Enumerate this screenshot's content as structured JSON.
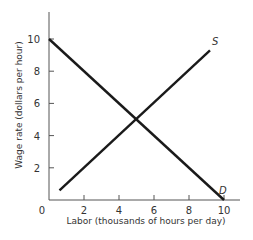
{
  "chart_data": {
    "type": "line",
    "title": "",
    "xlabel": "Labor (thousands of hours per day)",
    "ylabel": "Wage rate (dollars per hour)",
    "xlim": [
      0,
      10
    ],
    "ylim": [
      0,
      11
    ],
    "x_ticks": [
      2,
      4,
      6,
      8,
      10
    ],
    "y_ticks": [
      2,
      4,
      6,
      8,
      10
    ],
    "origin_label": "0",
    "grid": false,
    "legend": "none",
    "series": [
      {
        "name": "D",
        "label": "D",
        "description": "Labor demand",
        "x": [
          0,
          10
        ],
        "y": [
          10,
          0
        ]
      },
      {
        "name": "S",
        "label": "S",
        "description": "Labor supply",
        "x": [
          0.6,
          9.2
        ],
        "y": [
          0.6,
          9.3
        ]
      }
    ],
    "equilibrium": {
      "x": 5,
      "y": 5
    },
    "colors": {
      "line": "#1a1a1a",
      "axis": "#555555",
      "text": "#333333"
    }
  }
}
